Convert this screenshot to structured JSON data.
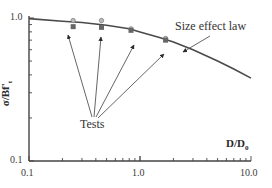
{
  "chart_data": {
    "type": "scatter",
    "title": "",
    "xlabel": "D/D0",
    "ylabel": "σ/Bf't",
    "xscale": "log",
    "yscale": "log",
    "xlim": [
      0.1,
      10.0
    ],
    "ylim": [
      0.1,
      1.0
    ],
    "x_ticks": [
      "0.1",
      "1.0",
      "10.0"
    ],
    "y_ticks": [
      "0.1",
      "1.0"
    ],
    "grid": false,
    "series": [
      {
        "name": "Size effect law",
        "kind": "line",
        "x": [
          0.1,
          0.2,
          0.3,
          0.5,
          0.8,
          1.0,
          1.5,
          2.0,
          3.0,
          5.0,
          7.0,
          10.0
        ],
        "y": [
          0.99,
          0.95,
          0.93,
          0.89,
          0.84,
          0.8,
          0.73,
          0.68,
          0.6,
          0.5,
          0.44,
          0.38
        ]
      },
      {
        "name": "Tests",
        "kind": "points",
        "x": [
          0.25,
          0.25,
          0.45,
          0.45,
          0.83,
          0.83,
          1.7,
          1.7
        ],
        "y": [
          0.96,
          0.87,
          0.96,
          0.86,
          0.84,
          0.82,
          0.72,
          0.7
        ]
      }
    ],
    "annotations": [
      {
        "text": "Size effect law",
        "points_to": "curve near D/D0 ≈ 2.2"
      },
      {
        "text": "Tests",
        "points_to": "four test data clusters"
      }
    ]
  },
  "labels": {
    "ylabel_main": "σ/Bf'",
    "ylabel_sub": "t",
    "xlabel_main": "D/D",
    "xlabel_sub": "0",
    "y_tick_top": "1.0",
    "y_tick_bottom": "0.1",
    "x_tick_left": "0.1",
    "x_tick_mid": "1.0",
    "x_tick_right": "10.0",
    "annotation_law": "Size effect law",
    "annotation_tests": "Tests"
  }
}
